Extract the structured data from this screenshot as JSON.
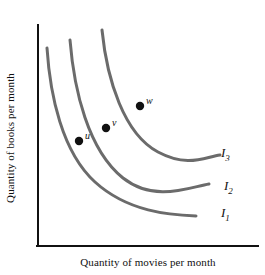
{
  "chart_data": {
    "type": "line",
    "title": "",
    "xlabel": "Quantity of movies per month",
    "ylabel": "Quantity of books per month",
    "grid": false,
    "legend_position": "right-inline",
    "axis_color": "#111111",
    "curve_color": "#6b6b6b",
    "marker_color": "#111111",
    "background": "#ffffff",
    "xlim": [
      0,
      100
    ],
    "ylim": [
      0,
      100
    ],
    "series": [
      {
        "name": "I1",
        "label": "I",
        "subscript": "1",
        "path": "M 47 48 C 50 95, 62 152, 95 182 C 128 212, 170 215, 196 216",
        "label_x": 221,
        "label_y": 205
      },
      {
        "name": "I2",
        "label": "I",
        "subscript": "2",
        "path": "M 70 40 C 74 90, 88 150, 123 178 C 155 203, 190 187, 209 184",
        "label_x": 224,
        "label_y": 178
      },
      {
        "name": "I3",
        "label": "I",
        "subscript": "3",
        "path": "M 102 30 C 107 80, 124 134, 158 152 C 188 168, 205 157, 220 155",
        "label_x": 221,
        "label_y": 145
      }
    ],
    "points": [
      {
        "name": "u",
        "label": "u",
        "x": 79,
        "y": 141,
        "label_x": 85,
        "label_y": 130,
        "on_curve": "I1"
      },
      {
        "name": "v",
        "label": "v",
        "x": 106,
        "y": 128,
        "label_x": 112,
        "label_y": 117,
        "on_curve": "I2"
      },
      {
        "name": "w",
        "label": "w",
        "x": 140,
        "y": 106,
        "label_x": 146,
        "label_y": 95,
        "on_curve": "I3"
      }
    ],
    "axes": {
      "y_axis": {
        "x": 38,
        "y_top": 25,
        "y_bottom": 246
      },
      "x_axis": {
        "y": 246,
        "x_left": 38,
        "x_right": 258
      }
    }
  }
}
